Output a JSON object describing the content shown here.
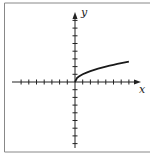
{
  "chart_data": {
    "type": "line",
    "title": "",
    "xlabel": "x",
    "ylabel": "y",
    "function": "y = sqrt(x)",
    "domain": [
      0,
      7
    ],
    "series": [
      {
        "name": "y = √x",
        "x": [
          0,
          0.25,
          0.5,
          1,
          1.5,
          2,
          2.5,
          3,
          3.5,
          4,
          4.5,
          5,
          5.5,
          6,
          6.5,
          7
        ],
        "y": [
          0,
          0.5,
          0.707,
          1,
          1.225,
          1.414,
          1.581,
          1.732,
          1.871,
          2,
          2.121,
          2.236,
          2.345,
          2.449,
          2.55,
          2.646
        ]
      }
    ],
    "xlim": [
      -8,
      8
    ],
    "ylim": [
      -8,
      9
    ],
    "x_ticks": [
      -7,
      -6,
      -5,
      -4,
      -3,
      -2,
      -1,
      1,
      2,
      3,
      4,
      5,
      6,
      7
    ],
    "y_ticks": [
      -8,
      -7,
      -6,
      -5,
      -4,
      -3,
      -2,
      -1,
      1,
      2,
      3,
      4,
      5,
      6,
      7,
      8
    ],
    "tick_labels_shown": false,
    "grid": false,
    "legend": "none",
    "frame": true,
    "colors": {
      "axis": "#222222",
      "curve": "#1a1a1a",
      "frame": "#888888"
    }
  }
}
